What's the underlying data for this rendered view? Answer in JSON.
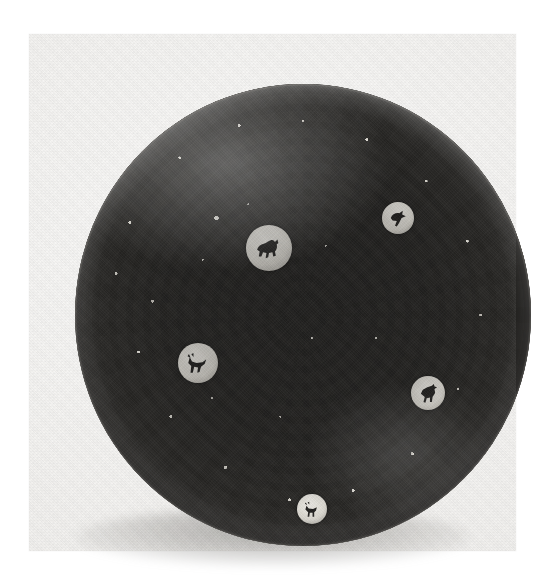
{
  "image": {
    "kind": "photograph",
    "medium": "black-and-white photographic print",
    "subject": "Close-packed millefiori glass paperweight",
    "subject_short": "Millefiori paperweight",
    "orientation": "portrait",
    "caption": "",
    "alt_text": "Black-and-white photograph of a domed close-packed millefiori glass paperweight, viewed from directly above, filled with hundreds of multicoloured glass canes including florets, honeycomb canes, star canes and animal silhouette canes."
  },
  "canvas": {
    "width_px": 548,
    "height_px": 576,
    "background_color": "#ffffff"
  },
  "print": {
    "label": "photographic print area",
    "left_px": 29,
    "top_px": 34,
    "width_px": 487,
    "height_px": 517,
    "paper_color": "#f4f3f1",
    "paper_highlight_color": "#fbfbfa"
  },
  "paperweight": {
    "label": "millefiori paperweight dome",
    "shape": "circle",
    "center_x_px": 274,
    "center_y_px": 281,
    "diameter_px": 456,
    "ground_color": "#1a1918",
    "cane_light_color": "#ece9e1",
    "cane_mid_color": "#b9b6ae",
    "cane_dark_color": "#201f1d",
    "rim_highlight_color": "#dedbd3",
    "shadow_color": "#3c3a37",
    "view": "top-down",
    "packing": "close-packed",
    "estimated_cane_count": "several hundred"
  },
  "cane_types": [
    {
      "name": "floret-cane",
      "label": "Floret cane"
    },
    {
      "name": "honeycomb-cane",
      "label": "Honeycomb cane"
    },
    {
      "name": "star-cane",
      "label": "Star cane"
    },
    {
      "name": "cogwheel-cane",
      "label": "Cogwheel cane"
    },
    {
      "name": "concentric-cane",
      "label": "Concentric ring cane"
    },
    {
      "name": "silhouette-cane",
      "label": "Silhouette cane"
    }
  ],
  "silhouettes": [
    {
      "name": "silhouette-cane-goat",
      "label": "Goat silhouette cane",
      "figure": "goat",
      "x_px": 203,
      "y_px": 194,
      "size_px": 46
    },
    {
      "name": "silhouette-cane-stag",
      "label": "Stag silhouette cane",
      "figure": "stag",
      "x_px": 131,
      "y_px": 308,
      "size_px": 40
    },
    {
      "name": "silhouette-cane-rooster",
      "label": "Rooster silhouette cane",
      "figure": "rooster",
      "x_px": 378,
      "y_px": 330,
      "size_px": 34
    },
    {
      "name": "silhouette-cane-deer",
      "label": "Deer silhouette cane",
      "figure": "deer",
      "x_px": 252,
      "y_px": 443,
      "size_px": 30
    },
    {
      "name": "silhouette-cane-bird",
      "label": "Bird silhouette cane",
      "figure": "bird",
      "x_px": 338,
      "y_px": 153,
      "size_px": 32
    }
  ],
  "shadow": {
    "label": "cast shadow",
    "center_x_px": 274,
    "top_px": 474,
    "width_px": 392,
    "height_px": 58,
    "color": "#3c3a37"
  }
}
